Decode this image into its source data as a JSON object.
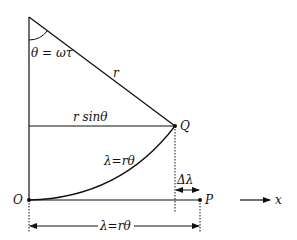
{
  "diagram": {
    "labels": {
      "theta_eq": "θ = ωτ",
      "r": "r",
      "r_sin_theta": "r sinθ",
      "Q": "Q",
      "lambda_curve": "λ=rθ",
      "delta_lambda": "Δλ",
      "O": "O",
      "P": "P",
      "lambda_bottom": "λ=rθ",
      "x": "x"
    },
    "colors": {
      "stroke": "#111111",
      "background": "#ffffff"
    }
  }
}
